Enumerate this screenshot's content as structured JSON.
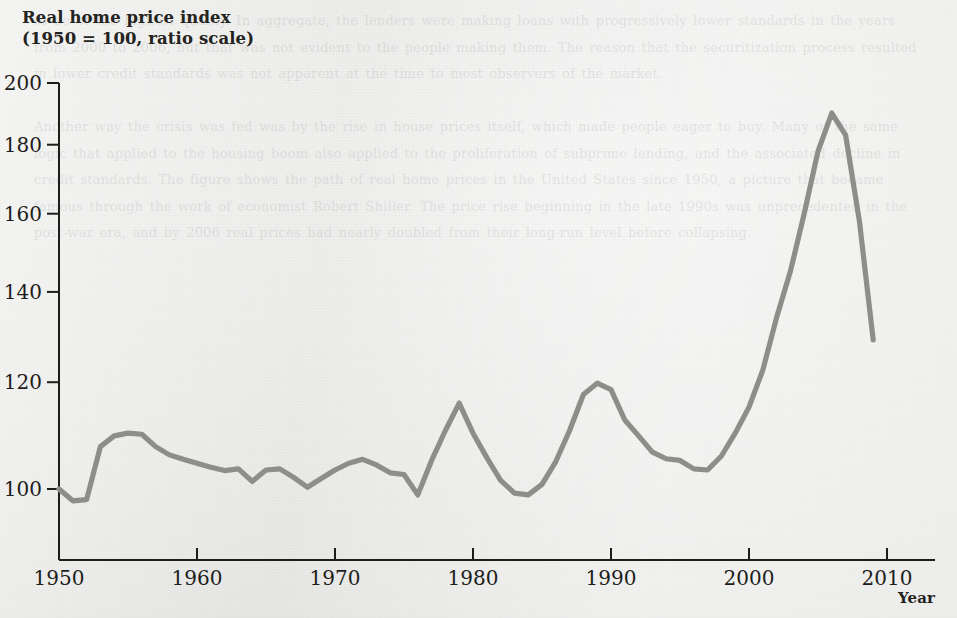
{
  "figure": {
    "y_axis_title": "Real home price index\n(1950 = 100, ratio scale)",
    "x_axis_title": "Year",
    "line_color": "#8d8d8a",
    "axis_color": "#1d1d1b",
    "background_color": "#ebebe9"
  },
  "bleed_through_text": "to be of the highest quality. In aggregate, the lenders were making loans with progressively lower standards in the years from 2000 to 2006, but that was not evident to the people making them. The reason that the securitization process resulted in lower credit standards was not apparent at the time to most observers of the market.\n\nAnother way the crisis was fed was by the rise in house prices itself, which made people eager to buy. Many of the same logic that applied to the housing boom also applied to the proliferation of subprime lending, and the associated decline in credit standards. The figure shows the path of real home prices in the United States since 1950, a picture that became famous through the work of economist Robert Shiller. The price rise beginning in the late 1990s was unprecedented in the post-war era, and by 2006 real prices had nearly doubled from their long-run level before collapsing.",
  "chart_data": {
    "type": "line",
    "title": "Real home price index",
    "subtitle": "(1950 = 100, ratio scale)",
    "xlabel": "Year",
    "ylabel": "Real home price index (1950 = 100, ratio scale)",
    "y_scale": "log",
    "xlim": [
      1950,
      2010
    ],
    "ylim": [
      95,
      203
    ],
    "grid": false,
    "legend": "none",
    "x_ticks": [
      1950,
      1960,
      1970,
      1980,
      1990,
      2000,
      2010
    ],
    "y_ticks": [
      100,
      120,
      140,
      160,
      180,
      200
    ],
    "series": [
      {
        "name": "Real home price index",
        "x": [
          1950,
          1951,
          1952,
          1953,
          1954,
          1955,
          1956,
          1957,
          1958,
          1959,
          1960,
          1961,
          1962,
          1963,
          1964,
          1965,
          1966,
          1967,
          1968,
          1969,
          1970,
          1971,
          1972,
          1973,
          1974,
          1975,
          1976,
          1977,
          1978,
          1979,
          1980,
          1981,
          1982,
          1983,
          1984,
          1985,
          1986,
          1987,
          1988,
          1989,
          1990,
          1991,
          1992,
          1993,
          1994,
          1995,
          1996,
          1997,
          1998,
          1999,
          2000,
          2001,
          2002,
          2003,
          2004,
          2005,
          2006,
          2007,
          2008,
          2009
        ],
        "values": [
          100.0,
          98.0,
          98.2,
          107.5,
          109.5,
          110.0,
          109.8,
          107.5,
          106.0,
          105.2,
          104.5,
          103.8,
          103.2,
          103.5,
          101.3,
          103.3,
          103.5,
          102.0,
          100.3,
          101.8,
          103.3,
          104.5,
          105.2,
          104.2,
          102.8,
          102.5,
          99.0,
          105.0,
          110.5,
          115.8,
          110.0,
          105.5,
          101.5,
          99.3,
          99.0,
          100.8,
          104.8,
          110.5,
          117.5,
          119.8,
          118.5,
          112.5,
          109.5,
          106.5,
          105.3,
          105.0,
          103.5,
          103.3,
          105.8,
          110.0,
          115.0,
          122.5,
          134.0,
          145.0,
          160.0,
          178.0,
          190.0,
          183.0,
          158.0,
          129.0
        ]
      }
    ],
    "annotations": []
  }
}
